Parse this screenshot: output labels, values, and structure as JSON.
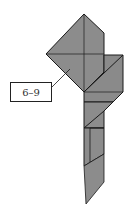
{
  "diagram": {
    "type": "origami-fold-diagram",
    "step_label": "6–9",
    "colors": {
      "paper_fill": "#8c8c8c",
      "paper_fill_dark": "#7a7a7a",
      "edge": "#1a1a1a",
      "background": "#ffffff"
    }
  }
}
